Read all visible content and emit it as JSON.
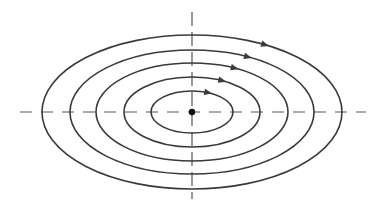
{
  "diagram": {
    "center": {
      "x": 192,
      "y": 112
    },
    "stroke_color": "#3a3a3a",
    "axis_color": "#555555",
    "ellipses": [
      {
        "rx": 150,
        "ry": 77,
        "arrow": {
          "x": 266,
          "y": 44
        }
      },
      {
        "rx": 122,
        "ry": 62,
        "arrow": {
          "x": 250,
          "y": 55
        }
      },
      {
        "rx": 96,
        "ry": 49,
        "arrow": {
          "x": 236,
          "y": 67
        }
      },
      {
        "rx": 68,
        "ry": 35,
        "arrow": {
          "x": 223,
          "y": 80
        }
      },
      {
        "rx": 41,
        "ry": 21,
        "arrow": {
          "x": 208,
          "y": 93
        }
      }
    ],
    "horizontal_axis": {
      "x1": 20,
      "x2": 366,
      "style": "dashed"
    },
    "vertical_axis": {
      "y1": 12,
      "y2": 199,
      "style": "dashed"
    },
    "direction": "clockwise"
  }
}
